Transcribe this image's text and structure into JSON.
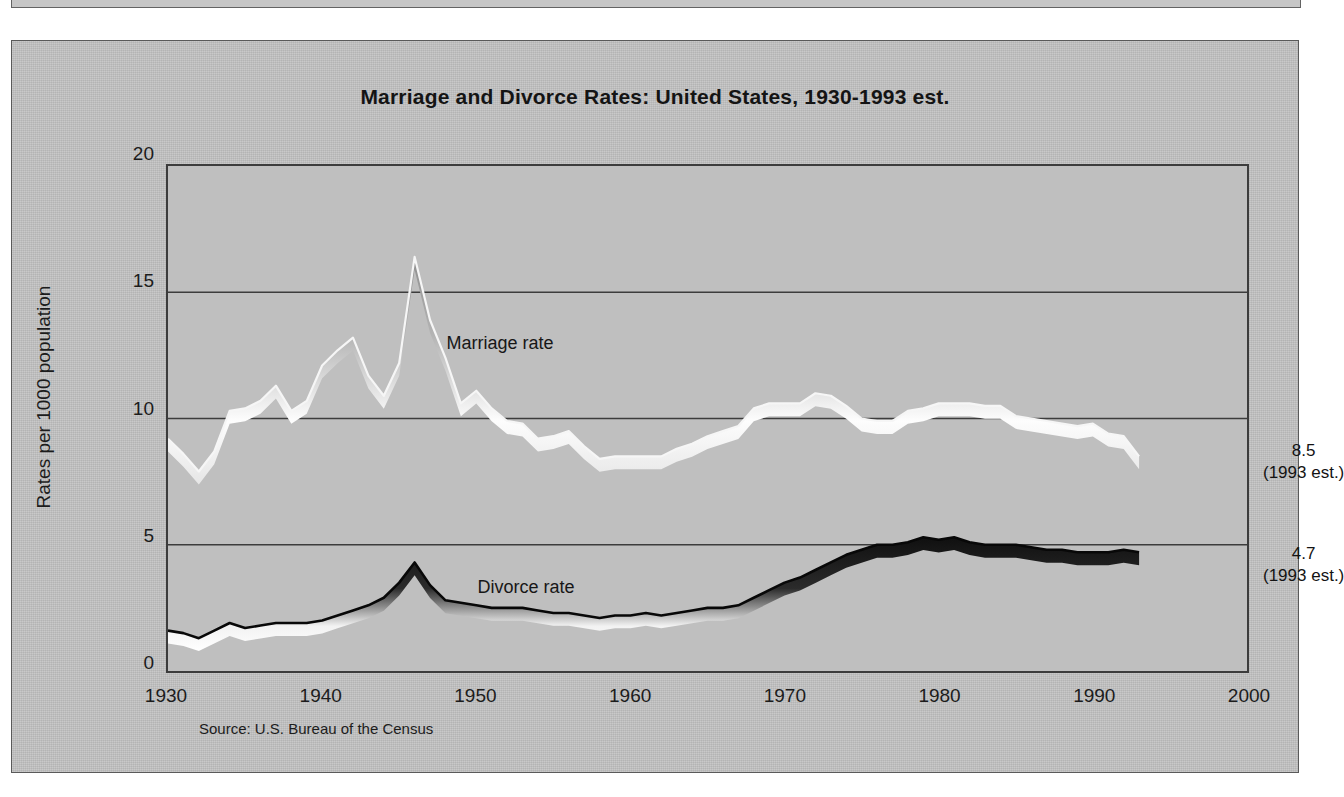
{
  "figure": {
    "title": "Marriage and Divorce Rates:  United States, 1930-1993 est.",
    "source": "Source:  U.S. Bureau of the Census",
    "background_color": "#c3c3c3",
    "plot_background_color": "#bfbfbf",
    "frame_color": "#3c3c3c"
  },
  "annotations": {
    "marriage_end": {
      "value": "8.5",
      "year_note": "(1993 est.)"
    },
    "divorce_end": {
      "value": "4.7",
      "year_note": "(1993 est.)"
    }
  },
  "chart_data": {
    "type": "line",
    "title": "Marriage and Divorce Rates:  United States, 1930-1993 est.",
    "xlabel": "",
    "ylabel": "Rates per 1000 population",
    "xlim": [
      1930,
      2000
    ],
    "ylim": [
      0,
      20
    ],
    "xticks": [
      "1930",
      "1940",
      "1950",
      "1960",
      "1970",
      "1980",
      "1990",
      "2000"
    ],
    "yticks": [
      "0",
      "5",
      "10",
      "15",
      "20"
    ],
    "grid": "horizontal",
    "gridlines": [
      0,
      5,
      10,
      15
    ],
    "legend": "inline-labels",
    "annotations": [
      {
        "text": "Marriage rate",
        "x": 1948,
        "y": 13.0
      },
      {
        "text": "Divorce rate",
        "x": 1950,
        "y": 3.4
      },
      {
        "text": "8.5",
        "x": 1995,
        "y": 8.7
      },
      {
        "text": "(1993 est.)",
        "x": 1995,
        "y": 7.9
      },
      {
        "text": "4.7",
        "x": 1995,
        "y": 4.5
      },
      {
        "text": "(1993 est.)",
        "x": 1995,
        "y": 3.7
      }
    ],
    "x": [
      1930,
      1931,
      1932,
      1933,
      1934,
      1935,
      1936,
      1937,
      1938,
      1939,
      1940,
      1941,
      1942,
      1943,
      1944,
      1945,
      1946,
      1947,
      1948,
      1949,
      1950,
      1951,
      1952,
      1953,
      1954,
      1955,
      1956,
      1957,
      1958,
      1959,
      1960,
      1961,
      1962,
      1963,
      1964,
      1965,
      1966,
      1967,
      1968,
      1969,
      1970,
      1971,
      1972,
      1973,
      1974,
      1975,
      1976,
      1977,
      1978,
      1979,
      1980,
      1981,
      1982,
      1983,
      1984,
      1985,
      1986,
      1987,
      1988,
      1989,
      1990,
      1991,
      1992,
      1993
    ],
    "series": [
      {
        "name": "Marriage rate",
        "style": "white-ribbon",
        "values": [
          9.2,
          8.6,
          7.9,
          8.7,
          10.3,
          10.4,
          10.7,
          11.3,
          10.3,
          10.7,
          12.1,
          12.7,
          13.2,
          11.7,
          10.9,
          12.2,
          16.4,
          13.9,
          12.4,
          10.6,
          11.1,
          10.4,
          9.9,
          9.8,
          9.2,
          9.3,
          9.5,
          8.9,
          8.4,
          8.5,
          8.5,
          8.5,
          8.5,
          8.8,
          9.0,
          9.3,
          9.5,
          9.7,
          10.4,
          10.6,
          10.6,
          10.6,
          11.0,
          10.9,
          10.5,
          10.0,
          9.9,
          9.9,
          10.3,
          10.4,
          10.6,
          10.6,
          10.6,
          10.5,
          10.5,
          10.1,
          10.0,
          9.9,
          9.8,
          9.7,
          9.8,
          9.4,
          9.3,
          8.5
        ]
      },
      {
        "name": "Divorce rate",
        "style": "dark-ribbon",
        "values": [
          1.6,
          1.5,
          1.3,
          1.6,
          1.9,
          1.7,
          1.8,
          1.9,
          1.9,
          1.9,
          2.0,
          2.2,
          2.4,
          2.6,
          2.9,
          3.5,
          4.3,
          3.4,
          2.8,
          2.7,
          2.6,
          2.5,
          2.5,
          2.5,
          2.4,
          2.3,
          2.3,
          2.2,
          2.1,
          2.2,
          2.2,
          2.3,
          2.2,
          2.3,
          2.4,
          2.5,
          2.5,
          2.6,
          2.9,
          3.2,
          3.5,
          3.7,
          4.0,
          4.3,
          4.6,
          4.8,
          5.0,
          5.0,
          5.1,
          5.3,
          5.2,
          5.3,
          5.1,
          5.0,
          5.0,
          5.0,
          4.9,
          4.8,
          4.8,
          4.7,
          4.7,
          4.7,
          4.8,
          4.7
        ]
      }
    ]
  }
}
